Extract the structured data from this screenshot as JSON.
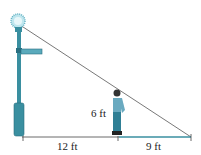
{
  "diagram": {
    "type": "similar-triangles-lamp-shadow",
    "labels": {
      "man_height": "6 ft",
      "distance_to_pole": "12 ft",
      "shadow_length": "9 ft"
    },
    "colors": {
      "pole": "#3a8fa0",
      "pole_dark": "#2a6f80",
      "light_glow": "#8fd0dd",
      "line": "#555555",
      "ground": "#3a8fa0",
      "man_shirt": "#6aaac0",
      "man_pants": "#2f7f95"
    }
  }
}
